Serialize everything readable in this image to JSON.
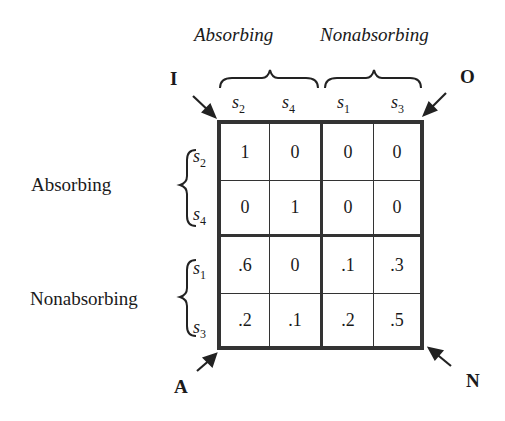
{
  "column_groups": [
    {
      "label": "Absorbing",
      "states": [
        "s2",
        "s4"
      ]
    },
    {
      "label": "Nonabsorbing",
      "states": [
        "s1",
        "s3"
      ]
    }
  ],
  "row_groups": [
    {
      "label": "Absorbing",
      "states": [
        "s2",
        "s4"
      ]
    },
    {
      "label": "Nonabsorbing",
      "states": [
        "s1",
        "s3"
      ]
    }
  ],
  "column_states": [
    {
      "base": "s",
      "sub": "2"
    },
    {
      "base": "s",
      "sub": "4"
    },
    {
      "base": "s",
      "sub": "1"
    },
    {
      "base": "s",
      "sub": "3"
    }
  ],
  "row_states": [
    {
      "base": "s",
      "sub": "2"
    },
    {
      "base": "s",
      "sub": "4"
    },
    {
      "base": "s",
      "sub": "1"
    },
    {
      "base": "s",
      "sub": "3"
    }
  ],
  "matrix": [
    [
      "1",
      "0",
      "0",
      "0"
    ],
    [
      "0",
      "1",
      "0",
      "0"
    ],
    [
      ".6",
      "0",
      ".1",
      ".3"
    ],
    [
      ".2",
      ".1",
      ".2",
      ".5"
    ]
  ],
  "corner_labels": {
    "top_left": "I",
    "top_right": "O",
    "bottom_left": "A",
    "bottom_right": "N"
  }
}
